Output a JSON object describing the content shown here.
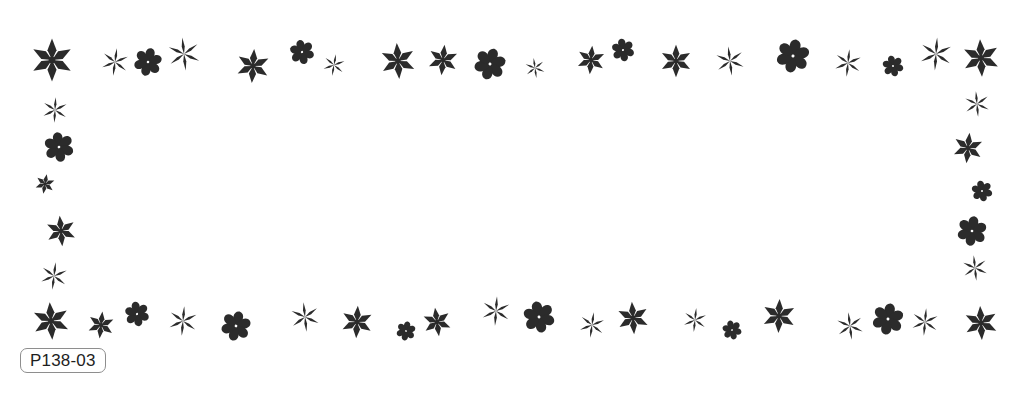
{
  "page": {
    "width": 1023,
    "height": 393,
    "background_color": "#ffffff",
    "ink_color": "#2b2b2b",
    "title": "P138-03"
  },
  "reference_label": {
    "text": "P138-03",
    "border_color": "#8e8e8e",
    "text_color": "#1e1e1e",
    "background_color": "#ffffff"
  },
  "ornament_frame": {
    "description": "Decorative rectangular border composed of asterisk and six-petal flower glyphs of varying size, weight and rotation",
    "glyph_kinds": {
      "star-thin": "six-pointed asterisk drawn with thin tapered strokes",
      "star-bold": "six-pointed asterisk drawn with thick tapered strokes",
      "flower-petal": "six rounded teardrop petals radiating from a small center"
    },
    "sides": {
      "top": "top-edge row of ornaments",
      "bottom": "bottom-edge row of ornaments",
      "left": "left-edge column of ornaments",
      "right": "right-edge column of ornaments"
    },
    "ornaments": [
      {
        "kind": "star-bold",
        "x": 52,
        "y": 60,
        "size": 48,
        "rot": 0,
        "side": "top"
      },
      {
        "kind": "star-thin",
        "x": 115,
        "y": 62,
        "size": 30,
        "rot": 8,
        "side": "top"
      },
      {
        "kind": "flower-petal",
        "x": 148,
        "y": 62,
        "size": 32,
        "rot": 14,
        "side": "top"
      },
      {
        "kind": "star-thin",
        "x": 184,
        "y": 54,
        "size": 36,
        "rot": -6,
        "side": "top"
      },
      {
        "kind": "star-bold",
        "x": 253,
        "y": 66,
        "size": 38,
        "rot": 4,
        "side": "top"
      },
      {
        "kind": "flower-petal",
        "x": 302,
        "y": 52,
        "size": 28,
        "rot": -12,
        "side": "top"
      },
      {
        "kind": "star-thin",
        "x": 334,
        "y": 65,
        "size": 24,
        "rot": 10,
        "side": "top"
      },
      {
        "kind": "star-bold",
        "x": 398,
        "y": 61,
        "size": 40,
        "rot": -4,
        "side": "top"
      },
      {
        "kind": "star-bold",
        "x": 443,
        "y": 60,
        "size": 34,
        "rot": 6,
        "side": "top"
      },
      {
        "kind": "flower-petal",
        "x": 490,
        "y": 64,
        "size": 36,
        "rot": 16,
        "side": "top"
      },
      {
        "kind": "star-thin",
        "x": 535,
        "y": 68,
        "size": 22,
        "rot": -8,
        "side": "top"
      },
      {
        "kind": "star-bold",
        "x": 591,
        "y": 60,
        "size": 32,
        "rot": 5,
        "side": "top"
      },
      {
        "kind": "flower-petal",
        "x": 623,
        "y": 50,
        "size": 26,
        "rot": -10,
        "side": "top"
      },
      {
        "kind": "star-bold",
        "x": 676,
        "y": 61,
        "size": 36,
        "rot": 0,
        "side": "top"
      },
      {
        "kind": "star-thin",
        "x": 730,
        "y": 61,
        "size": 32,
        "rot": -7,
        "side": "top"
      },
      {
        "kind": "flower-petal",
        "x": 793,
        "y": 56,
        "size": 38,
        "rot": 12,
        "side": "top"
      },
      {
        "kind": "star-thin",
        "x": 848,
        "y": 63,
        "size": 30,
        "rot": 6,
        "side": "top"
      },
      {
        "kind": "flower-petal",
        "x": 893,
        "y": 66,
        "size": 24,
        "rot": -14,
        "side": "top"
      },
      {
        "kind": "star-thin",
        "x": 936,
        "y": 54,
        "size": 36,
        "rot": 4,
        "side": "top"
      },
      {
        "kind": "star-bold",
        "x": 981,
        "y": 58,
        "size": 42,
        "rot": -3,
        "side": "top"
      },
      {
        "kind": "star-thin",
        "x": 55,
        "y": 110,
        "size": 28,
        "rot": 3,
        "side": "left"
      },
      {
        "kind": "flower-petal",
        "x": 59,
        "y": 147,
        "size": 34,
        "rot": -8,
        "side": "left"
      },
      {
        "kind": "star-bold",
        "x": 45,
        "y": 184,
        "size": 22,
        "rot": 10,
        "side": "left"
      },
      {
        "kind": "star-bold",
        "x": 61,
        "y": 231,
        "size": 34,
        "rot": -5,
        "side": "left"
      },
      {
        "kind": "star-thin",
        "x": 54,
        "y": 276,
        "size": 30,
        "rot": 7,
        "side": "left"
      },
      {
        "kind": "star-thin",
        "x": 977,
        "y": 104,
        "size": 28,
        "rot": -5,
        "side": "right"
      },
      {
        "kind": "star-bold",
        "x": 968,
        "y": 148,
        "size": 34,
        "rot": 6,
        "side": "right"
      },
      {
        "kind": "flower-petal",
        "x": 982,
        "y": 191,
        "size": 24,
        "rot": -12,
        "side": "right"
      },
      {
        "kind": "flower-petal",
        "x": 972,
        "y": 231,
        "size": 34,
        "rot": 9,
        "side": "right"
      },
      {
        "kind": "star-thin",
        "x": 975,
        "y": 268,
        "size": 28,
        "rot": -6,
        "side": "right"
      },
      {
        "kind": "star-bold",
        "x": 51,
        "y": 321,
        "size": 42,
        "rot": -4,
        "side": "bottom"
      },
      {
        "kind": "star-bold",
        "x": 101,
        "y": 325,
        "size": 30,
        "rot": 6,
        "side": "bottom"
      },
      {
        "kind": "flower-petal",
        "x": 137,
        "y": 314,
        "size": 28,
        "rot": -10,
        "side": "bottom"
      },
      {
        "kind": "star-thin",
        "x": 183,
        "y": 321,
        "size": 32,
        "rot": 5,
        "side": "bottom"
      },
      {
        "kind": "flower-petal",
        "x": 236,
        "y": 326,
        "size": 34,
        "rot": 14,
        "side": "bottom"
      },
      {
        "kind": "star-thin",
        "x": 305,
        "y": 317,
        "size": 32,
        "rot": -6,
        "side": "bottom"
      },
      {
        "kind": "star-bold",
        "x": 357,
        "y": 322,
        "size": 36,
        "rot": 3,
        "side": "bottom"
      },
      {
        "kind": "flower-petal",
        "x": 406,
        "y": 331,
        "size": 22,
        "rot": 11,
        "side": "bottom"
      },
      {
        "kind": "star-bold",
        "x": 437,
        "y": 322,
        "size": 32,
        "rot": -8,
        "side": "bottom"
      },
      {
        "kind": "star-thin",
        "x": 496,
        "y": 311,
        "size": 32,
        "rot": 4,
        "side": "bottom"
      },
      {
        "kind": "flower-petal",
        "x": 539,
        "y": 317,
        "size": 36,
        "rot": -12,
        "side": "bottom"
      },
      {
        "kind": "star-thin",
        "x": 592,
        "y": 325,
        "size": 28,
        "rot": 8,
        "side": "bottom"
      },
      {
        "kind": "star-bold",
        "x": 633,
        "y": 318,
        "size": 36,
        "rot": -4,
        "side": "bottom"
      },
      {
        "kind": "star-thin",
        "x": 695,
        "y": 320,
        "size": 26,
        "rot": 6,
        "side": "bottom"
      },
      {
        "kind": "flower-petal",
        "x": 732,
        "y": 330,
        "size": 22,
        "rot": -15,
        "side": "bottom"
      },
      {
        "kind": "star-bold",
        "x": 779,
        "y": 316,
        "size": 38,
        "rot": 2,
        "side": "bottom"
      },
      {
        "kind": "star-thin",
        "x": 850,
        "y": 326,
        "size": 30,
        "rot": -7,
        "side": "bottom"
      },
      {
        "kind": "flower-petal",
        "x": 888,
        "y": 319,
        "size": 36,
        "rot": 10,
        "side": "bottom"
      },
      {
        "kind": "star-thin",
        "x": 925,
        "y": 322,
        "size": 30,
        "rot": 5,
        "side": "bottom"
      },
      {
        "kind": "star-bold",
        "x": 981,
        "y": 323,
        "size": 38,
        "rot": -3,
        "side": "bottom"
      }
    ]
  }
}
